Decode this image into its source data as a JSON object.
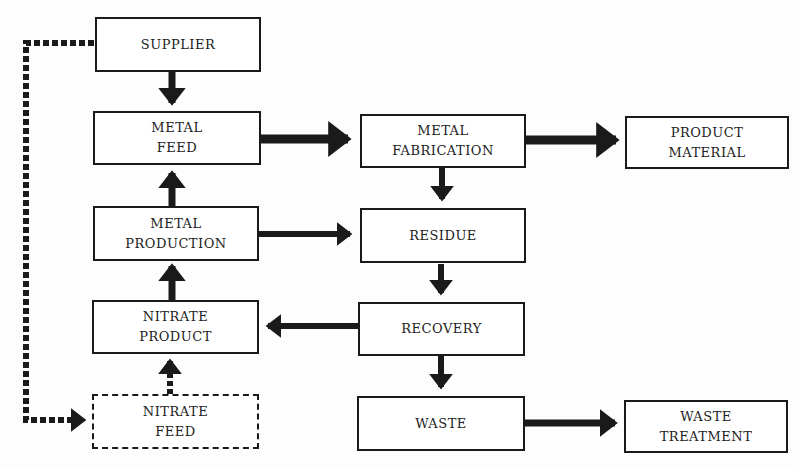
{
  "diagram": {
    "title": "",
    "nodes": [
      {
        "id": "supplier",
        "label": "SUPPLIER",
        "style": "solid"
      },
      {
        "id": "metal_feed",
        "label": "METAL\nFEED",
        "style": "solid"
      },
      {
        "id": "metal_production",
        "label": "METAL\nPRODUCTION",
        "style": "solid"
      },
      {
        "id": "nitrate_product",
        "label": "NITRATE\nPRODUCT",
        "style": "solid"
      },
      {
        "id": "nitrate_feed",
        "label": "NITRATE\nFEED",
        "style": "dashed"
      },
      {
        "id": "metal_fabrication",
        "label": "METAL\nFABRICATION",
        "style": "solid"
      },
      {
        "id": "residue",
        "label": "RESIDUE",
        "style": "solid"
      },
      {
        "id": "recovery",
        "label": "RECOVERY",
        "style": "solid"
      },
      {
        "id": "waste",
        "label": "WASTE",
        "style": "solid"
      },
      {
        "id": "product_material",
        "label": "PRODUCT\nMATERIAL",
        "style": "solid"
      },
      {
        "id": "waste_treatment",
        "label": "WASTE\nTREATMENT",
        "style": "solid"
      }
    ],
    "edges": [
      {
        "from": "supplier",
        "to": "metal_feed",
        "style": "solid"
      },
      {
        "from": "metal_production",
        "to": "metal_feed",
        "style": "solid"
      },
      {
        "from": "nitrate_product",
        "to": "metal_production",
        "style": "solid"
      },
      {
        "from": "nitrate_feed",
        "to": "nitrate_product",
        "style": "dashed"
      },
      {
        "from": "supplier",
        "to": "nitrate_feed",
        "style": "dashed"
      },
      {
        "from": "metal_feed",
        "to": "metal_fabrication",
        "style": "solid"
      },
      {
        "from": "metal_fabrication",
        "to": "product_material",
        "style": "solid"
      },
      {
        "from": "metal_fabrication",
        "to": "residue",
        "style": "solid"
      },
      {
        "from": "metal_production",
        "to": "residue",
        "style": "solid"
      },
      {
        "from": "residue",
        "to": "recovery",
        "style": "solid"
      },
      {
        "from": "recovery",
        "to": "nitrate_product",
        "style": "solid"
      },
      {
        "from": "recovery",
        "to": "waste",
        "style": "solid"
      },
      {
        "from": "waste",
        "to": "waste_treatment",
        "style": "solid"
      }
    ],
    "colors": {
      "line": "#1a1a1a",
      "box_fill": "#ffffff",
      "background": "#fdfdfd"
    }
  }
}
